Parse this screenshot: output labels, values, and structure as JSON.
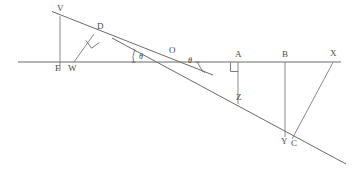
{
  "figure": {
    "kind": "geometry-diagram",
    "background_color": "#ffffff",
    "stroke_color": "#6b6b6b",
    "label_color": "#4a4a4a",
    "width": 352,
    "height": 180
  },
  "labels": {
    "v": "V",
    "d": "D",
    "e": "E",
    "w": "W",
    "o": "O",
    "a": "A",
    "b": "B",
    "x": "X",
    "z": "Z",
    "y": "Y",
    "c": "C",
    "theta_left": "θ",
    "theta_right": "θ"
  },
  "label_positions": {
    "v": {
      "x": 57,
      "y": 4
    },
    "d": {
      "x": 97,
      "y": 23
    },
    "e": {
      "x": 55,
      "y": 64
    },
    "w": {
      "x": 68,
      "y": 64
    },
    "o": {
      "x": 170,
      "y": 47
    },
    "a": {
      "x": 236,
      "y": 51
    },
    "b": {
      "x": 283,
      "y": 51
    },
    "x": {
      "x": 331,
      "y": 50
    },
    "z": {
      "x": 239,
      "y": 93
    },
    "y": {
      "x": 283,
      "y": 138
    },
    "c": {
      "x": 292,
      "y": 140
    },
    "theta_left": {
      "x": 139,
      "y": 55
    },
    "theta_right": {
      "x": 187,
      "y": 58
    }
  },
  "points": {
    "v": {
      "x": 60,
      "y": 16
    },
    "d": {
      "x": 94,
      "y": 34
    },
    "e": {
      "x": 60,
      "y": 62
    },
    "w": {
      "x": 74,
      "y": 62
    },
    "o": {
      "x": 172,
      "y": 62
    },
    "a": {
      "x": 238,
      "y": 62
    },
    "b": {
      "x": 285,
      "y": 62
    },
    "x": {
      "x": 333,
      "y": 62
    },
    "z": {
      "x": 238,
      "y": 100
    },
    "y": {
      "x": 285,
      "y": 135
    },
    "c": {
      "x": 292,
      "y": 137
    }
  },
  "segments": {
    "baseline": {
      "from": "x:18,y:62",
      "to": "x:341,y:62"
    },
    "upper_ray": {
      "from": "x:52,y:12",
      "to": "x:212,y:75"
    },
    "descending_ray": {
      "from": "x:113,y:39",
      "to": "x:346,y:164"
    },
    "ev_vertical": {
      "from": "x:60,y:16",
      "to": "x:60,y:70"
    },
    "wd_perp": {
      "from": "x:74,y:62",
      "to": "x:94,y:34"
    },
    "az_vertical": {
      "from": "x:238,y:62",
      "to": "x:238,y:104"
    },
    "by_vertical": {
      "from": "x:285,y:62",
      "to": "x:285,y:137"
    },
    "xc_slant": {
      "from": "x:333,y:62",
      "to": "x:292,y:139"
    }
  },
  "right_angle_marks": [
    {
      "at": "D",
      "note": "square at D between WD and upper ray"
    },
    {
      "at": "A",
      "note": "square at A between baseline and AZ"
    }
  ],
  "angle_marks": [
    {
      "label": "θ",
      "vertex": "O",
      "side": "left",
      "between": [
        "upper ray",
        "baseline"
      ]
    },
    {
      "label": "θ",
      "vertex": "O",
      "side": "right",
      "between": [
        "baseline",
        "descending ray"
      ]
    }
  ]
}
